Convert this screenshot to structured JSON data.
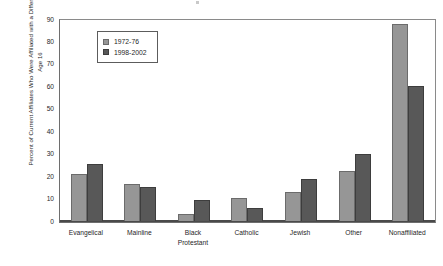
{
  "chart_data": {
    "type": "bar",
    "title": "",
    "subtitle": "",
    "xlabel": "",
    "ylabel": "Percent of Current Affiliates Who Were Affiliated with a Different Tradition at Age 16",
    "ylim": [
      0,
      90
    ],
    "ytick_step": 10,
    "yticks": [
      0,
      10,
      20,
      30,
      40,
      50,
      60,
      70,
      80,
      90
    ],
    "ytick_labels": [
      "0",
      "10",
      "20",
      "30",
      "40",
      "50",
      "60",
      "70",
      "80",
      "90"
    ],
    "grid": false,
    "frame": true,
    "legend_position": "upper-left-inside",
    "categories": [
      "Evangelical",
      "Mainline",
      "Black\nProtestant",
      "Catholic",
      "Jewish",
      "Other",
      "Nonaffiliated"
    ],
    "series": [
      {
        "name": "1972-76",
        "color": "#969696",
        "values": [
          21,
          16.3,
          3.2,
          10.3,
          13.1,
          22.2,
          88
        ]
      },
      {
        "name": "1998-2002",
        "color": "#585858",
        "values": [
          25.5,
          15.2,
          9.2,
          6,
          18.5,
          30,
          60
        ]
      }
    ],
    "annotations": []
  },
  "legend": {
    "entries": [
      {
        "label": "1972-76",
        "swatch": "light-gray-swatch-icon"
      },
      {
        "label": "1998-2002",
        "swatch": "dark-gray-swatch-icon"
      }
    ]
  },
  "colors": {
    "series_1972_76": "#969696",
    "series_1998_2002": "#585858",
    "axis": "#4a4a4a",
    "frame": "#6e6e6e",
    "text": "#1f1f1f",
    "background": "#ffffff"
  }
}
